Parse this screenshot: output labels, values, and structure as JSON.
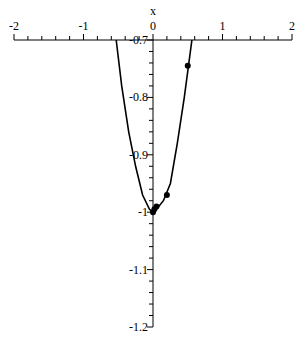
{
  "chart_data": {
    "type": "line",
    "title": "",
    "xlabel": "x",
    "ylabel": "",
    "xlim": [
      -2,
      2
    ],
    "ylim": [
      -1.2,
      -0.7
    ],
    "x_axis_position_y": -0.7,
    "grid": false,
    "x_ticks": [
      "-2",
      "-1",
      "0",
      "1",
      "2"
    ],
    "y_ticks": [
      "-0.7",
      "-0.8",
      "-0.9",
      "-1",
      "-1.1",
      "-1.2"
    ],
    "series": [
      {
        "name": "curve",
        "style": "line",
        "x": [
          -0.53,
          -0.45,
          -0.35,
          -0.25,
          -0.15,
          -0.05,
          0.0,
          0.05,
          0.15,
          0.25,
          0.35,
          0.45,
          0.56
        ],
        "y": [
          -0.7,
          -0.78,
          -0.86,
          -0.92,
          -0.97,
          -0.995,
          -1.0,
          -0.995,
          -0.98,
          -0.95,
          -0.88,
          -0.8,
          -0.7
        ]
      },
      {
        "name": "points",
        "style": "markers",
        "x": [
          0.5,
          0.2,
          0.05,
          0.02,
          0.0
        ],
        "y": [
          -0.745,
          -0.97,
          -0.99,
          -0.995,
          -1.0
        ]
      }
    ]
  }
}
